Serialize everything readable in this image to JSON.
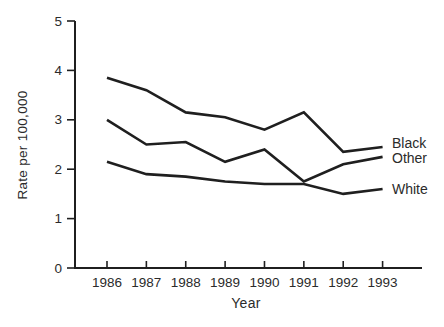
{
  "figure": {
    "background": "#ffffff",
    "text_color": "#2b2b2b",
    "line_color": "#1f1f1f"
  },
  "chart_data": {
    "type": "line",
    "xlabel": "Year",
    "ylabel": "Rate per 100,000",
    "x": [
      1986,
      1987,
      1988,
      1989,
      1990,
      1991,
      1992,
      1993
    ],
    "ylim": [
      0,
      5
    ],
    "yticks": [
      0,
      1,
      2,
      3,
      4,
      5
    ],
    "grid": false,
    "legend_position": "end-of-line-labels",
    "series": [
      {
        "name": "Black",
        "values": [
          3.85,
          3.6,
          3.15,
          3.05,
          2.8,
          3.15,
          2.35,
          2.45
        ]
      },
      {
        "name": "Other",
        "values": [
          3.0,
          2.5,
          2.55,
          2.15,
          2.4,
          1.75,
          2.1,
          2.25
        ]
      },
      {
        "name": "White",
        "values": [
          2.15,
          1.9,
          1.85,
          1.75,
          1.7,
          1.7,
          1.5,
          1.6
        ]
      }
    ]
  }
}
